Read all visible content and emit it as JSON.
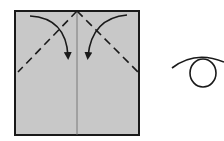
{
  "diagram": {
    "type": "origami-fold-step",
    "paper_color": "#c8c8c8",
    "line_color": "#1a1a1a",
    "elements": [
      {
        "name": "paper-square",
        "description": "Gray square sheet with vertical center crease"
      },
      {
        "name": "valley-fold-left",
        "description": "Dashed diagonal fold line from top center to left edge"
      },
      {
        "name": "valley-fold-right",
        "description": "Dashed diagonal fold line from top center to right edge"
      },
      {
        "name": "fold-arrow-left",
        "description": "Curved arrow folding top-left corner to center"
      },
      {
        "name": "fold-arrow-right",
        "description": "Curved arrow folding top-right corner to center"
      },
      {
        "name": "turn-over-symbol",
        "description": "Looped arrow indicating turn model over"
      }
    ]
  }
}
